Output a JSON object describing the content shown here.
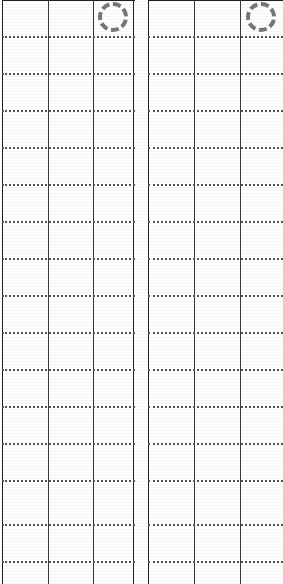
{
  "document": {
    "kind": "scanned-ruled-grid-form",
    "background_color": "#ffffff",
    "width": 283,
    "height": 584,
    "description": "Cropped scan of two ruled grid panels with dotted row rules, solid column rules and a dashed circle mark on each panel"
  },
  "ink": {
    "column_rule_color": "#3a3a3a",
    "outer_rule_color": "#222222",
    "row_rule_color": "#555555",
    "ring_color": "#777777",
    "paper_color": "#fefefe"
  },
  "geometry": {
    "row_rule_spacing": 37,
    "row_rule_first_y": 36,
    "row_rule_count": 15,
    "row_rule_thickness": 2,
    "column_rule_thickness": 1.4,
    "top_rule_thickness": 1.4
  },
  "blocks": [
    {
      "id": "left-panel",
      "label": "Left ruled panel",
      "x": 2,
      "width": 133,
      "has_right_edge": true,
      "column_rules_x": [
        0,
        46,
        91,
        131
      ],
      "ring": {
        "label": "dashed circle mark",
        "cx": 111,
        "cy": 17,
        "diameter": 30
      }
    },
    {
      "id": "right-panel",
      "label": "Right ruled panel",
      "x": 148,
      "width": 135,
      "has_right_edge": false,
      "column_rules_x": [
        0,
        46,
        92
      ],
      "ring": {
        "label": "dashed circle mark",
        "cx": 113,
        "cy": 17,
        "diameter": 30
      }
    }
  ],
  "row_rules_y": [
    36,
    73,
    110,
    147,
    184,
    221,
    258,
    295,
    332,
    369,
    406,
    443,
    480,
    524,
    561
  ]
}
